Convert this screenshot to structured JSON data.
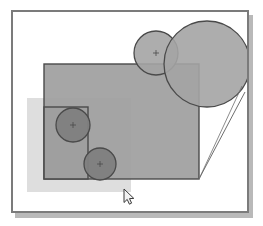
{
  "app": {
    "title": "Vector Drawing Canvas",
    "canvas_label": "drawing-canvas",
    "background_color": "#ffffff",
    "frame_border_color": "#7b7b7b",
    "shadow_color": "#b9b9b9"
  },
  "palette": {
    "rect_fill_main": "#9e9e9e",
    "rect_fill_light": "#d6d6d6",
    "rect_fill_mid": "#b0b0b0",
    "circle_fill_light": "#a8a8a8",
    "circle_fill_dark": "#7d7d7d",
    "stroke_color": "#4a4a4a",
    "connector_color": "#6e6e6e",
    "cursor_fill": "#f2f2f2",
    "cursor_stroke": "#3a3a3a"
  },
  "shapes": [
    {
      "id": "rect-light-lower-left",
      "name": "rectangle-light-lower-left",
      "type": "rect",
      "x": 14,
      "y": 86,
      "width": 104,
      "height": 94,
      "fill": "#d8d8d8",
      "opacity": 0.85,
      "stroke": "none",
      "stroke_width": 0
    },
    {
      "id": "rect-main",
      "name": "rectangle-main",
      "type": "rect",
      "x": 31,
      "y": 52,
      "width": 155,
      "height": 115,
      "fill": "#9e9e9e",
      "opacity": 0.92,
      "stroke": "#4a4a4a",
      "stroke_width": 1.4
    },
    {
      "id": "rect-inner",
      "name": "rectangle-inner-left",
      "type": "rect",
      "x": 31,
      "y": 95,
      "width": 44,
      "height": 72,
      "fill": "#9a9a9a",
      "opacity": 0.55,
      "stroke": "#4a4a4a",
      "stroke_width": 1.4
    },
    {
      "id": "circle-small-top",
      "name": "circle-small-top",
      "type": "circle",
      "cx": 143,
      "cy": 41,
      "r": 22,
      "fill": "#a4a4a4",
      "opacity": 0.9,
      "stroke": "#4a4a4a",
      "stroke_width": 1.3,
      "center_marker": true
    },
    {
      "id": "circle-large-top-right",
      "name": "circle-large-top-right",
      "type": "circle",
      "cx": 194,
      "cy": 52,
      "r": 43,
      "fill": "#a4a4a4",
      "opacity": 0.9,
      "stroke": "#4a4a4a",
      "stroke_width": 1.3,
      "center_marker": false
    },
    {
      "id": "circle-mid-left",
      "name": "circle-mid-left",
      "type": "circle",
      "cx": 60,
      "cy": 113,
      "r": 17,
      "fill": "#7f7f7f",
      "opacity": 0.95,
      "stroke": "#4a4a4a",
      "stroke_width": 1.3,
      "center_marker": true
    },
    {
      "id": "circle-lower-left",
      "name": "circle-lower-left",
      "type": "circle",
      "cx": 87,
      "cy": 152,
      "r": 16,
      "fill": "#7f7f7f",
      "opacity": 0.95,
      "stroke": "#4a4a4a",
      "stroke_width": 1.3,
      "center_marker": true
    }
  ],
  "connectors": [
    {
      "id": "connector-tangent",
      "name": "connector-line-tangent",
      "type": "line",
      "x1": 232,
      "y1": 80,
      "x2": 186,
      "y2": 167,
      "stroke": "#6e6e6e",
      "stroke_width": 1
    },
    {
      "id": "connector-tangent-2",
      "name": "connector-line-tangent-secondary",
      "type": "line",
      "x1": 229,
      "y1": 74,
      "x2": 186,
      "y2": 167,
      "stroke": "#6e6e6e",
      "stroke_width": 0.8
    }
  ],
  "cursor": {
    "name": "mouse-pointer",
    "x": 124,
    "y": 189,
    "type": "arrow-pointer"
  }
}
